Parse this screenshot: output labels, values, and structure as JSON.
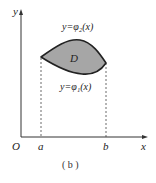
{
  "figure": {
    "caption": "( b )",
    "axes": {
      "x_label": "x",
      "y_label": "y",
      "origin_label": "O"
    },
    "ticks": {
      "a": "a",
      "b": "b"
    },
    "region_label": "D",
    "upper_curve_label": "y=φ₂(x)",
    "lower_curve_label": "y=φ₁(x)",
    "colors": {
      "region_fill": "#a6a6a6",
      "stroke": "#222222"
    }
  }
}
